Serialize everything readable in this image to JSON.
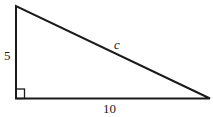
{
  "diagram": {
    "type": "right-triangle",
    "labels": {
      "vertical_leg": "5",
      "horizontal_leg": "10",
      "hypotenuse": "c"
    },
    "stroke_color": "#1a1a1a",
    "background": "#ffffff"
  }
}
